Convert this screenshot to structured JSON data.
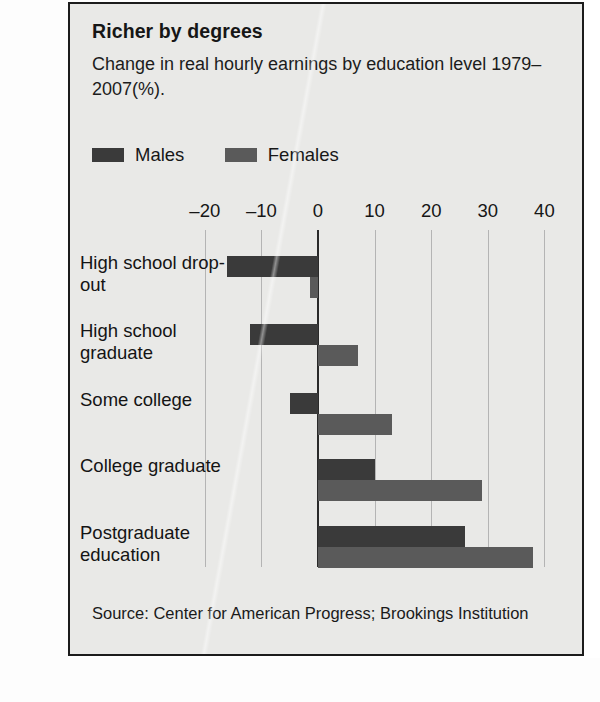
{
  "figure": {
    "title": "Richer by degrees",
    "subtitle": "Change in real hourly earnings by education level 1979–2007(%).",
    "source": "Source: Center for American Progress; Brookings Institution"
  },
  "legend": {
    "items": [
      {
        "label": "Males",
        "color": "#3a3a3a"
      },
      {
        "label": "Females",
        "color": "#5a5a5a"
      }
    ]
  },
  "chart_data": {
    "type": "bar",
    "orientation": "horizontal",
    "title": "Richer by degrees",
    "subtitle": "Change in real hourly earnings by education level 1979–2007(%).",
    "xlabel": "",
    "ylabel": "",
    "xlim": [
      -25,
      45
    ],
    "xticks": [
      -20,
      -10,
      0,
      10,
      20,
      30,
      40
    ],
    "xtick_labels": [
      "–20",
      "–10",
      "0",
      "10",
      "20",
      "30",
      "40"
    ],
    "grid": true,
    "legend_position": "top-left",
    "categories": [
      "High school drop-out",
      "High school graduate",
      "Some college",
      "College graduate",
      "Postgraduate education"
    ],
    "series": [
      {
        "name": "Males",
        "color": "#3a3a3a",
        "values": [
          -16,
          -12,
          -5,
          10,
          26
        ]
      },
      {
        "name": "Females",
        "color": "#5a5a5a",
        "values": [
          -1.5,
          7,
          13,
          29,
          38
        ]
      }
    ],
    "source": "Source: Center for American Progress; Brookings Institution"
  }
}
